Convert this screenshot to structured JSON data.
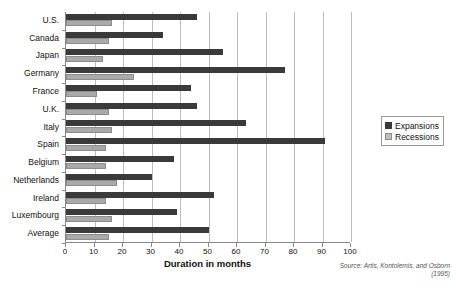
{
  "chart_data": {
    "type": "bar",
    "orientation": "horizontal",
    "title": "",
    "xlabel": "Duration in months",
    "ylabel": "",
    "xlim": [
      0,
      100
    ],
    "xticks": [
      0,
      10,
      20,
      30,
      40,
      50,
      60,
      70,
      80,
      90,
      100
    ],
    "grid": true,
    "legend_position": "right",
    "categories": [
      "U.S.",
      "Canada",
      "Japan",
      "Germany",
      "France",
      "U.K.",
      "Italy",
      "Spain",
      "Belgium",
      "Netherlands",
      "Ireland",
      "Luxembourg",
      "Average"
    ],
    "series": [
      {
        "name": "Expansions",
        "color": "#3a3a3a",
        "values": [
          46,
          34,
          55,
          77,
          44,
          46,
          63,
          91,
          38,
          30,
          52,
          39,
          50
        ]
      },
      {
        "name": "Recessions",
        "color": "#bfbfbf",
        "values": [
          16,
          15,
          13,
          24,
          11,
          15,
          16,
          14,
          14,
          18,
          14,
          16,
          15
        ]
      }
    ],
    "annotation": "Source: Artis, Kontolemis, and Osborn (1995)"
  },
  "legend": {
    "items": [
      {
        "label": "Expansions",
        "swatch": "expansions-swatch"
      },
      {
        "label": "Recessions",
        "swatch": "recessions-swatch"
      }
    ]
  }
}
